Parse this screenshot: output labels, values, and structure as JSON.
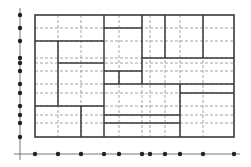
{
  "diagram": {
    "title": "",
    "type": "rectangular-partition-with-projections",
    "colors": {
      "solid_line": "#3a3a3a",
      "dashed_line": "#9a9a9a",
      "axis": "#555555",
      "dot": "#222222",
      "background": "#ffffff"
    },
    "outer_rect": {
      "x1": 35,
      "y1": 15,
      "x2": 234,
      "y2": 137
    },
    "x_axis": {
      "y": 154,
      "from": 14,
      "to": 240,
      "dots": [
        35,
        58,
        81,
        104,
        119,
        142,
        150,
        165,
        180,
        203,
        234
      ]
    },
    "y_axis": {
      "x": 20,
      "from": 8,
      "to": 160,
      "dots": [
        15,
        28,
        41,
        58,
        63,
        71,
        84,
        93,
        106,
        115,
        123,
        137
      ]
    },
    "dashed_vertical": [
      58,
      81,
      119,
      142,
      150,
      165,
      180,
      203
    ],
    "dashed_horizontal": [
      28,
      41,
      58,
      63,
      71,
      84,
      93,
      106,
      115,
      123
    ],
    "solid_segments": [
      {
        "x1": 104,
        "y1": 15,
        "x2": 104,
        "y2": 137
      },
      {
        "x1": 35,
        "y1": 41,
        "x2": 104,
        "y2": 41
      },
      {
        "x1": 58,
        "y1": 41,
        "x2": 58,
        "y2": 106
      },
      {
        "x1": 58,
        "y1": 63,
        "x2": 104,
        "y2": 63
      },
      {
        "x1": 35,
        "y1": 106,
        "x2": 104,
        "y2": 106
      },
      {
        "x1": 81,
        "y1": 106,
        "x2": 81,
        "y2": 137
      },
      {
        "x1": 104,
        "y1": 28,
        "x2": 142,
        "y2": 28
      },
      {
        "x1": 142,
        "y1": 15,
        "x2": 142,
        "y2": 84
      },
      {
        "x1": 165,
        "y1": 15,
        "x2": 165,
        "y2": 58
      },
      {
        "x1": 203,
        "y1": 15,
        "x2": 203,
        "y2": 58
      },
      {
        "x1": 142,
        "y1": 58,
        "x2": 234,
        "y2": 58
      },
      {
        "x1": 104,
        "y1": 71,
        "x2": 142,
        "y2": 71
      },
      {
        "x1": 119,
        "y1": 71,
        "x2": 119,
        "y2": 84
      },
      {
        "x1": 104,
        "y1": 84,
        "x2": 234,
        "y2": 84
      },
      {
        "x1": 180,
        "y1": 84,
        "x2": 180,
        "y2": 137
      },
      {
        "x1": 180,
        "y1": 93,
        "x2": 234,
        "y2": 93
      },
      {
        "x1": 104,
        "y1": 115,
        "x2": 180,
        "y2": 115
      },
      {
        "x1": 104,
        "y1": 123,
        "x2": 180,
        "y2": 123
      }
    ]
  }
}
